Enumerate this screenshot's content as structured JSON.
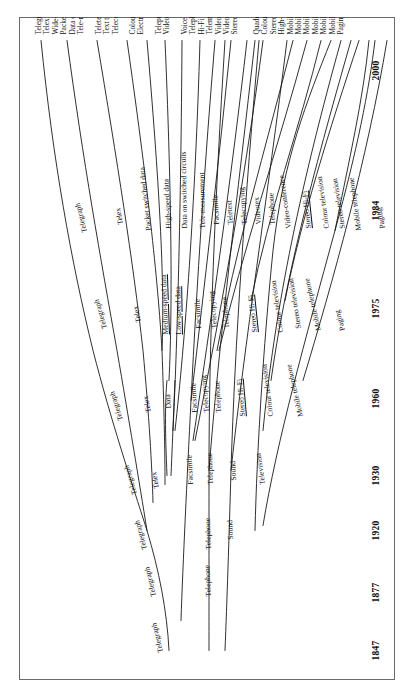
{
  "figure": {
    "kind": "evolutionary-tree-diagram",
    "orientation": "rotated-90-ccw",
    "page_background": "#ffffff",
    "line_color": "#1a1a1a",
    "border_color": "#6a6a6a"
  },
  "axis": {
    "label": "",
    "years": [
      "1847",
      "1877",
      "1920",
      "1930",
      "1960",
      "1975",
      "1984",
      "2000"
    ]
  },
  "branch_labels": [
    {
      "text": "Telegraph",
      "era": "1847"
    },
    {
      "text": "Telegraph",
      "era": "1877"
    },
    {
      "text": "Telephone",
      "era": "1877"
    },
    {
      "text": "Telegraph",
      "era": "1920"
    },
    {
      "text": "Telephone",
      "era": "1920"
    },
    {
      "text": "Sound",
      "era": "1920"
    },
    {
      "text": "Telegraph",
      "era": "1930"
    },
    {
      "text": "Telex",
      "era": "1930"
    },
    {
      "text": "Facsimile",
      "era": "1930"
    },
    {
      "text": "Telephone",
      "era": "1930"
    },
    {
      "text": "Sound",
      "era": "1930"
    },
    {
      "text": "Television",
      "era": "1930"
    },
    {
      "text": "Telegraph",
      "era": "1960"
    },
    {
      "text": "Telex",
      "era": "1960"
    },
    {
      "text": "Data",
      "era": "1960"
    },
    {
      "text": "Facsimile",
      "era": "1960"
    },
    {
      "text": "Telecopying",
      "era": "1960"
    },
    {
      "text": "Telephone",
      "era": "1960"
    },
    {
      "text": "Stereo Hi-Fi",
      "era": "1960"
    },
    {
      "text": "Colour television",
      "era": "1960"
    },
    {
      "text": "Mobile telephone",
      "era": "1960"
    },
    {
      "text": "Telegraph",
      "era": "1975"
    },
    {
      "text": "Telex",
      "era": "1975"
    },
    {
      "text": "Medium-speed data",
      "era": "1975"
    },
    {
      "text": "Low-speed data",
      "era": "1975"
    },
    {
      "text": "Facsimile",
      "era": "1975"
    },
    {
      "text": "Telecopying",
      "era": "1975"
    },
    {
      "text": "Telephone",
      "era": "1975"
    },
    {
      "text": "Stereo Hi-Fi",
      "era": "1975"
    },
    {
      "text": "Colour television",
      "era": "1975"
    },
    {
      "text": "Stereo television",
      "era": "1975"
    },
    {
      "text": "Mobile telephone",
      "era": "1975"
    },
    {
      "text": "Paging",
      "era": "1975"
    },
    {
      "text": "Telegraph",
      "era": "1984"
    },
    {
      "text": "Telex",
      "era": "1984"
    },
    {
      "text": "Packet switched data",
      "era": "1984"
    },
    {
      "text": "High-speed data",
      "era": "1984"
    },
    {
      "text": "Data on switched circuits",
      "era": "1984"
    },
    {
      "text": "Tele-measurement",
      "era": "1984"
    },
    {
      "text": "Facsimile",
      "era": "1984"
    },
    {
      "text": "Teletext",
      "era": "1984"
    },
    {
      "text": "Telecopying",
      "era": "1984"
    },
    {
      "text": "Videotex",
      "era": "1984"
    },
    {
      "text": "Telephone",
      "era": "1984"
    },
    {
      "text": "Video-conference",
      "era": "1984"
    },
    {
      "text": "Stereo Hi-Fi",
      "era": "1984"
    },
    {
      "text": "Colour television",
      "era": "1984"
    },
    {
      "text": "Stereo television",
      "era": "1984"
    },
    {
      "text": "Mobile telephone",
      "era": "1984"
    },
    {
      "text": "Paging",
      "era": "1984"
    }
  ],
  "terminal_groups": [
    {
      "name": "telegraph-data-group",
      "items": [
        "Telegraph",
        "Telex",
        "Wide-band data",
        "Packet switched data",
        "Data on switched circuits",
        "Tele-measurement"
      ]
    },
    {
      "name": "text-telecopy-group",
      "items": [
        "Teletext",
        "Text telecopying",
        "Telecopying"
      ]
    },
    {
      "name": "colour-telecopy-group",
      "items": [
        "Colour telecopying",
        "Electronic mail"
      ]
    },
    {
      "name": "newspaper-videotex-group",
      "items": [
        "Teleprinting of newspapers",
        "Videotex"
      ]
    },
    {
      "name": "telephony-group",
      "items": [
        "Voice telecopying",
        "Telephone",
        "Hi-Fi telephone",
        "Telemeeting conference",
        "Video-conference",
        "Videophony",
        "Stereo Hi-Fi"
      ]
    },
    {
      "name": "broadcast-mobile-group",
      "items": [
        "Quadrophony",
        "Colour television",
        "Stereo television",
        "High-definition television",
        "Mobile videophone",
        "Mobile telephone",
        "Mobile text",
        "Mobile telecopying",
        "Mobile data",
        "Mobile videotex",
        "Paging"
      ]
    }
  ]
}
